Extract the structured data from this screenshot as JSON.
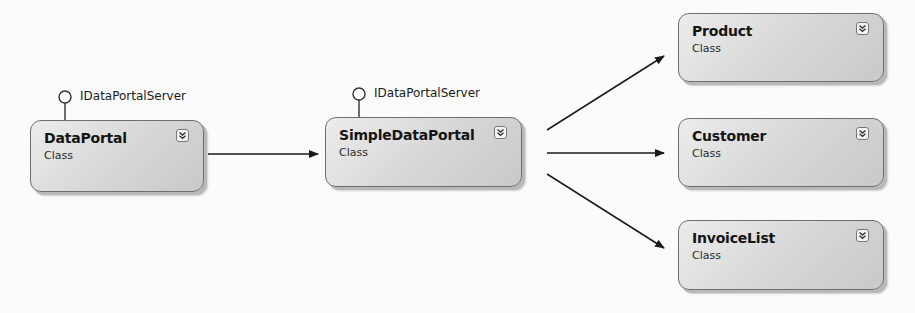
{
  "diagram": {
    "type": "class-diagram",
    "shapes": [
      {
        "id": "dataportal",
        "name": "DataPortal",
        "kind": "Class",
        "interface": "IDataPortalServer",
        "toggle_icon": "double-chevron-down-icon"
      },
      {
        "id": "simpledataportal",
        "name": "SimpleDataPortal",
        "kind": "Class",
        "interface": "IDataPortalServer",
        "toggle_icon": "double-chevron-down-icon"
      },
      {
        "id": "product",
        "name": "Product",
        "kind": "Class",
        "toggle_icon": "double-chevron-down-icon"
      },
      {
        "id": "customer",
        "name": "Customer",
        "kind": "Class",
        "toggle_icon": "double-chevron-down-icon"
      },
      {
        "id": "invoicelist",
        "name": "InvoiceList",
        "kind": "Class",
        "toggle_icon": "double-chevron-down-icon"
      }
    ],
    "associations": [
      {
        "from": "DataPortal",
        "to": "SimpleDataPortal"
      },
      {
        "from": "SimpleDataPortal",
        "to": "Product"
      },
      {
        "from": "SimpleDataPortal",
        "to": "Customer"
      },
      {
        "from": "SimpleDataPortal",
        "to": "InvoiceList"
      }
    ],
    "colors": {
      "shape_fill": "#d6d6d6",
      "shape_border": "#6e6e6e",
      "connector": "#1a1a1a"
    }
  }
}
